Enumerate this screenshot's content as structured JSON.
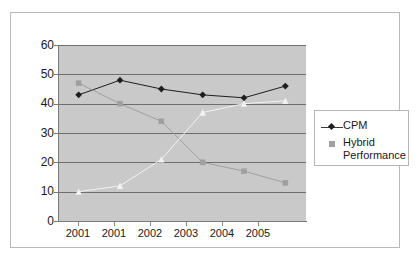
{
  "chart_data": {
    "type": "line",
    "title": "",
    "xlabel": "",
    "ylabel": "",
    "ylim": [
      0,
      60
    ],
    "ytick_step": 10,
    "grid": true,
    "legend_position": "right",
    "plot_background": "#c9c9c9",
    "categories": [
      "2001",
      "2001",
      "2002",
      "2003",
      "2004",
      "2005"
    ],
    "yticks": [
      "0",
      "10",
      "20",
      "30",
      "40",
      "50",
      "60"
    ],
    "series": [
      {
        "name": "CPM",
        "marker": "diamond",
        "color": "#1e1e1e",
        "in_legend": true,
        "values": [
          43,
          48,
          45,
          43,
          42,
          46
        ]
      },
      {
        "name": "Hybrid Performance",
        "marker": "square",
        "color": "#a0a0a0",
        "in_legend": true,
        "values": [
          47,
          40,
          34,
          20,
          17,
          13
        ]
      },
      {
        "name": "",
        "marker": "triangle",
        "color": "#f2f2f2",
        "in_legend": false,
        "values": [
          10,
          12,
          21,
          37,
          40,
          41
        ]
      }
    ]
  },
  "legend": {
    "entries": [
      {
        "label": "CPM",
        "marker": "diamond-line"
      },
      {
        "label": "Hybrid",
        "marker": "square"
      }
    ],
    "wrapped_label": "Performance"
  }
}
